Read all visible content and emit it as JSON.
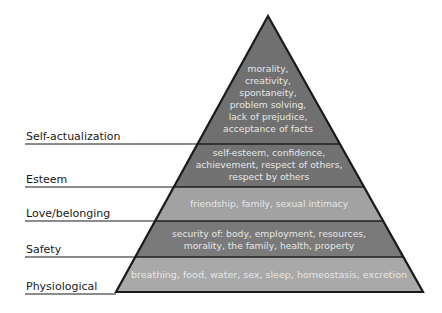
{
  "diagram": {
    "type": "pyramid",
    "colors": {
      "dark_band": "#737373",
      "light_band": "#a3a3a3",
      "outline": "#1a1a1a",
      "label_text": "#1a1a1a",
      "band_text": "#e6e6e6"
    },
    "levels": [
      {
        "label": "Self-actualization",
        "lines": [
          "morality,",
          "creativity,",
          "spontaneity,",
          "problem solving,",
          "lack of prejudice,",
          "acceptance of facts"
        ]
      },
      {
        "label": "Esteem",
        "lines": [
          "self-esteem, confidence,",
          "achievement, respect of others,",
          "respect by others"
        ]
      },
      {
        "label": "Love/belonging",
        "lines": [
          "friendship, family, sexual intimacy"
        ]
      },
      {
        "label": "Safety",
        "lines": [
          "security of: body, employment, resources,",
          "morality, the family, health, property"
        ]
      },
      {
        "label": "Physiological",
        "lines": [
          "breathing, food, water, sex, sleep, homeostasis, excretion"
        ]
      }
    ]
  }
}
